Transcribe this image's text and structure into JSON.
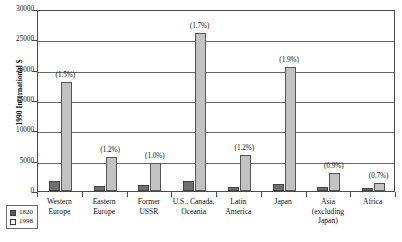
{
  "chart_data": {
    "type": "bar",
    "title": "",
    "xlabel": "",
    "ylabel": "1990 International $",
    "ylim": [
      0,
      30000
    ],
    "yticks": [
      0,
      5000,
      10000,
      15000,
      20000,
      25000,
      30000
    ],
    "ytick_labels": [
      "0",
      "5000",
      "10000",
      "15000",
      "20000",
      "25000",
      "30000"
    ],
    "grid": true,
    "legend_position": "below-left",
    "categories": [
      "Western Europe",
      "Eastern Europe",
      "Former USSR",
      "U.S., Canada, Oceania",
      "Latin America",
      "Japan",
      "Asia (excluding Japan)",
      "Africa"
    ],
    "category_lines": [
      [
        "Western",
        "Europe"
      ],
      [
        "Eastern",
        "Europe"
      ],
      [
        "Former",
        "USSR"
      ],
      [
        "U.S., Canada,",
        "Oceania"
      ],
      [
        "Latin",
        "America"
      ],
      [
        "Japan"
      ],
      [
        "Asia",
        "(excluding",
        "Japan)"
      ],
      [
        "Africa"
      ]
    ],
    "series": [
      {
        "name": "1820",
        "color": "#6f6f6f",
        "values": [
          1700,
          900,
          1000,
          1700,
          700,
          1200,
          600,
          500
        ]
      },
      {
        "name": "1998",
        "color": "#c2c2c2",
        "values": [
          18000,
          5600,
          4600,
          26100,
          6000,
          20500,
          3000,
          1400
        ]
      }
    ],
    "annotations": [
      "(1.5%)",
      "(1.2%)",
      "(1.0%)",
      "(1.7%)",
      "(1.2%)",
      "(1.9%)",
      "(0.9%)",
      "(0.7%)"
    ]
  }
}
